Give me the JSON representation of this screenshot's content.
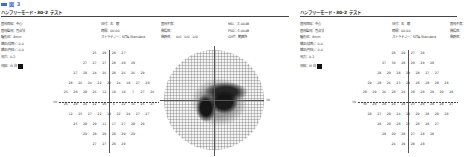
{
  "figure_label": "図 3",
  "panels": [
    {
      "title": "ハンフリーモード・30-2 テスト",
      "info_left": [
        "固視目標：中心",
        "固視監視：盲点法",
        "瞳孔径：4mm",
        "矯正(球面)：0.0",
        "矯正(円柱)：0.0",
        "視力：0.2"
      ],
      "info_mid": [
        "日付：右　眼",
        "時間：00:00",
        "ストラテジー：SITA-Standard"
      ],
      "info_right": [
        "固視不良：",
        "偽陽性：",
        "偽陰性：　0/0　0/0　0/0"
      ],
      "info_far": [
        "MD：-5.00dB",
        "PSD：5.00dB",
        "GHT：範囲外"
      ],
      "stimulus": "視標：III 白",
      "axis_labels": {
        "left": "30",
        "right": "30"
      },
      "threshold_rows": [
        [
          "25",
          "29",
          "28",
          "27"
        ],
        [
          "27",
          "27",
          "27",
          "28",
          "28",
          "29"
        ],
        [
          "27",
          "28",
          "24",
          "26",
          "28",
          "26",
          "26",
          "29"
        ],
        [
          "28",
          "26",
          "24",
          "22",
          "20",
          "24",
          "18",
          "27",
          "28"
        ],
        [
          "25",
          "28",
          "28",
          "26",
          "12",
          "18",
          "18",
          "7",
          "27",
          "26"
        ],
        [
          "26",
          "28",
          "26",
          "22",
          "20",
          "6",
          "22",
          "16",
          "25",
          "27"
        ],
        [
          "12",
          "25",
          "27",
          "22",
          "18",
          "22",
          "24",
          "27",
          "27"
        ],
        [
          "25",
          "28",
          "29",
          "11",
          "17",
          "27",
          "28",
          "29"
        ],
        [
          "29",
          "28",
          "29",
          "28",
          "29",
          "29"
        ],
        [
          "27",
          "27",
          "28",
          "29"
        ]
      ]
    },
    {
      "title": "ハンフリーモード・30-2 テスト",
      "info_left": [
        "固視目標：中心",
        "固視監視：盲点法",
        "瞳孔径：4mm",
        "矯正(球面)：0.0",
        "矯正(円柱)：0.0",
        "視力：0.2"
      ],
      "info_mid": [
        "日付：右　眼",
        "時間：00:00",
        "ストラテジー：SITA-Standard"
      ],
      "info_right": [
        "固視不良：",
        "偽陽性：",
        "偽陰性："
      ],
      "stimulus": "視標：III 白",
      "axis_labels": {
        "left": "30",
        "right": "30"
      },
      "threshold_rows": [
        [
          "28",
          "29",
          "27",
          "28"
        ],
        [
          "27",
          "30",
          "28",
          "29",
          "29",
          "28"
        ],
        [
          "28",
          "29",
          "28",
          "29",
          "28",
          "27",
          "27"
        ],
        [
          "29",
          "28",
          "26",
          "23",
          "29",
          "28",
          "28",
          "28",
          "28"
        ],
        [
          "28",
          "29",
          "26",
          "28",
          "24",
          "28",
          "28",
          "29",
          "29",
          "28"
        ],
        [
          "30",
          "28",
          "28",
          "24",
          "28",
          "23",
          "28",
          "28",
          "28",
          "27"
        ],
        [
          "28",
          "27",
          "28",
          "24",
          "28",
          "29",
          "28",
          "28",
          "28"
        ],
        [
          "28",
          "29",
          "28",
          "27",
          "28",
          "28",
          "27"
        ],
        [
          "28",
          "29",
          "28",
          "27",
          "28",
          "28"
        ],
        [
          "24",
          "29",
          "28",
          "28"
        ]
      ]
    }
  ]
}
